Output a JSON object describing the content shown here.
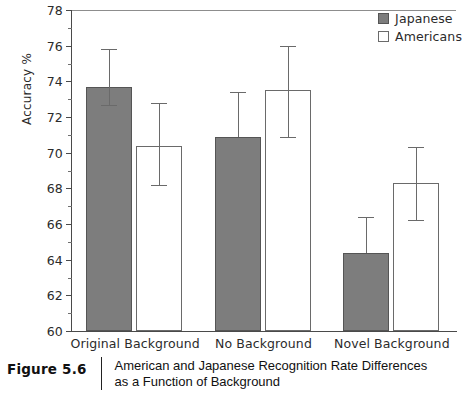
{
  "figure": {
    "number_label": "Figure 5.6",
    "caption_line1": "American and Japanese Recognition Rate Differences",
    "caption_line2": "as a Function of Background"
  },
  "legend": {
    "position": "top-right",
    "entries": [
      {
        "label": "Japanese",
        "swatch": "filled-gray-square",
        "color": "#7d7d7d"
      },
      {
        "label": "Americans",
        "swatch": "open-white-square",
        "color": "#ffffff"
      }
    ]
  },
  "chart_data": {
    "type": "bar",
    "title": "",
    "subtitle": "",
    "xlabel": "",
    "ylabel": "Accuracy %",
    "ylim": [
      60,
      78
    ],
    "ytick_step": 2,
    "yticks": [
      60,
      62,
      64,
      66,
      68,
      70,
      72,
      74,
      76,
      78
    ],
    "ytick_labels": [
      "60",
      "62",
      "64",
      "66",
      "68",
      "70",
      "72",
      "74",
      "76",
      "78"
    ],
    "grid": false,
    "legend_position": "top-right",
    "categories": [
      "Original Background",
      "No Background",
      "Novel Background"
    ],
    "series": [
      {
        "name": "Japanese",
        "color": "#7d7d7d",
        "values": [
          73.7,
          70.9,
          64.4
        ],
        "err_upper": [
          75.8,
          73.4,
          66.4
        ],
        "err_lower": [
          72.7,
          70.9,
          64.4
        ]
      },
      {
        "name": "Americans",
        "color": "#ffffff",
        "values": [
          70.4,
          73.5,
          68.3
        ],
        "err_upper": [
          72.8,
          76.0,
          70.3
        ],
        "err_lower": [
          68.2,
          70.9,
          66.2
        ]
      }
    ]
  }
}
